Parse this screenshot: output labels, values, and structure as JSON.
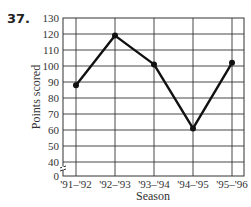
{
  "problem": {
    "number": "37."
  },
  "chart_data": {
    "type": "line",
    "title": "",
    "xlabel": "Season",
    "ylabel": "Points scored",
    "categories": [
      "'91–'92",
      "'92–'93",
      "'93–'94",
      "'94–'95",
      "'95–'96"
    ],
    "values": [
      88,
      119,
      101,
      61,
      102
    ],
    "ylim": [
      0,
      130
    ],
    "y_ticks": [
      0,
      40,
      50,
      60,
      70,
      80,
      90,
      100,
      110,
      120,
      130
    ],
    "y_axis_break": true,
    "grid": true,
    "legend": "none",
    "colors": {
      "line": "#111111",
      "grid": "#333333"
    }
  }
}
